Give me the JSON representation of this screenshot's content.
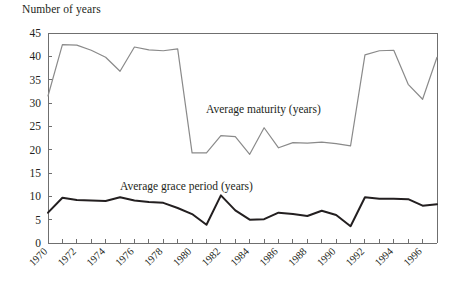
{
  "figure": {
    "axis_title": "Number of years",
    "annotations": {
      "maturity": "Average maturity (years)",
      "grace": "Average grace period (years)"
    },
    "colors": {
      "maturity_line": "#8a8a8a",
      "grace_line": "#231f20",
      "axis": "#6f6f6f",
      "text": "#231f20",
      "background": "#ffffff"
    }
  },
  "chart_data": {
    "type": "line",
    "title": "",
    "subtitle": "",
    "xlabel": "",
    "ylabel": "Number of years",
    "ylim": [
      0,
      45
    ],
    "ytick_values": [
      0,
      5,
      10,
      15,
      20,
      25,
      30,
      35,
      40,
      45
    ],
    "ytick_labels": [
      "0",
      "5",
      "10",
      "15",
      "20",
      "25",
      "30",
      "35",
      "40",
      "45"
    ],
    "xlim": [
      1970,
      1997
    ],
    "x": [
      1970,
      1971,
      1972,
      1973,
      1974,
      1975,
      1976,
      1977,
      1978,
      1979,
      1980,
      1981,
      1982,
      1983,
      1984,
      1985,
      1986,
      1987,
      1988,
      1989,
      1990,
      1991,
      1992,
      1993,
      1994,
      1995,
      1996,
      1997
    ],
    "xtick_values": [
      1970,
      1971,
      1972,
      1973,
      1974,
      1975,
      1976,
      1977,
      1978,
      1979,
      1980,
      1981,
      1982,
      1983,
      1984,
      1985,
      1986,
      1987,
      1988,
      1989,
      1990,
      1991,
      1992,
      1993,
      1994,
      1995,
      1996,
      1997
    ],
    "xtick_labels_shown": [
      "1970",
      "1972",
      "1974",
      "1976",
      "1978",
      "1980",
      "1982",
      "1984",
      "1986",
      "1988",
      "1990",
      "1992",
      "1994",
      "1996"
    ],
    "xtick_label_rotation": -45,
    "grid": false,
    "legend": "none (inline annotations)",
    "series": [
      {
        "name": "Average maturity (years)",
        "color": "#8a8a8a",
        "values": [
          31.5,
          42.5,
          42.4,
          41.3,
          39.8,
          36.8,
          42.0,
          41.4,
          41.2,
          41.6,
          19.3,
          19.3,
          23.0,
          22.8,
          19.0,
          24.7,
          20.4,
          21.5,
          21.4,
          21.6,
          21.3,
          20.8,
          40.3,
          41.2,
          41.3,
          34.0,
          30.8,
          39.8
        ]
      },
      {
        "name": "Average grace period (years)",
        "color": "#231f20",
        "values": [
          6.5,
          9.7,
          9.2,
          9.1,
          9.0,
          9.8,
          9.1,
          8.8,
          8.6,
          7.5,
          6.2,
          3.9,
          10.2,
          7.0,
          5.0,
          5.1,
          6.5,
          6.2,
          5.8,
          6.9,
          6.0,
          3.6,
          9.8,
          9.5,
          9.5,
          9.4,
          8.0,
          8.3
        ]
      }
    ]
  }
}
